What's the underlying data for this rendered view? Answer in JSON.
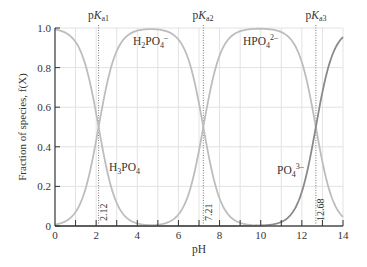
{
  "chart_data": {
    "type": "line",
    "title": "",
    "xlabel": "pH",
    "ylabel": "Fraction of species, f(X)",
    "xlim": [
      0,
      14
    ],
    "ylim": [
      0,
      1.0
    ],
    "grid": true,
    "x_ticks": [
      0,
      2,
      4,
      6,
      8,
      10,
      12,
      14
    ],
    "y_ticks": [
      0,
      0.2,
      0.4,
      0.6,
      0.8,
      1.0
    ],
    "y_tick_labels": [
      "0",
      "0.2",
      "0.4",
      "0.6",
      "0.8",
      "1.0"
    ],
    "pKa": [
      {
        "label": "pKa1",
        "value": 2.12
      },
      {
        "label": "pKa2",
        "value": 7.21
      },
      {
        "label": "pKa3",
        "value": 12.68
      }
    ],
    "series": [
      {
        "name": "H3PO4",
        "label_main": "H",
        "color": "#bdbdbd"
      },
      {
        "name": "H2PO4-",
        "color": "#bdbdbd"
      },
      {
        "name": "HPO4 2-",
        "color": "#bdbdbd"
      },
      {
        "name": "PO4 3-",
        "color": "#8a8a8a"
      }
    ],
    "sample_points": {
      "x": [
        0,
        1,
        2.12,
        3,
        4,
        5,
        6,
        7.21,
        8,
        9,
        10,
        11,
        12,
        12.68,
        14
      ],
      "H3PO4": [
        0.99,
        0.93,
        0.5,
        0.12,
        0.01,
        0.0,
        0.0,
        0.0,
        0.0,
        0.0,
        0.0,
        0.0,
        0.0,
        0.0,
        0.0
      ],
      "H2PO4-": [
        0.01,
        0.07,
        0.5,
        0.88,
        0.99,
        0.99,
        0.94,
        0.5,
        0.14,
        0.02,
        0.0,
        0.0,
        0.0,
        0.0,
        0.0
      ],
      "HPO4 2-": [
        0.0,
        0.0,
        0.0,
        0.0,
        0.0,
        0.01,
        0.06,
        0.5,
        0.86,
        0.98,
        1.0,
        0.98,
        0.83,
        0.5,
        0.05
      ],
      "PO4 3-": [
        0.0,
        0.0,
        0.0,
        0.0,
        0.0,
        0.0,
        0.0,
        0.0,
        0.0,
        0.0,
        0.0,
        0.02,
        0.17,
        0.5,
        0.95
      ]
    }
  },
  "labels": {
    "pKa1": {
      "p": "p",
      "K": "K",
      "sub": "a1"
    },
    "pKa2": {
      "p": "p",
      "K": "K",
      "sub": "a2"
    },
    "pKa3": {
      "p": "p",
      "K": "K",
      "sub": "a3"
    },
    "pKa1_value": "2.12",
    "pKa2_value": "7.21",
    "pKa3_value": "12.68",
    "H3PO4": {
      "a": "H",
      "s1": "3",
      "b": "PO",
      "s2": "4",
      "sup": ""
    },
    "H2PO4": {
      "a": "H",
      "s1": "2",
      "b": "PO",
      "s2": "4",
      "sup": "–"
    },
    "HPO4": {
      "a": "HPO",
      "s2": "4",
      "sup": "2–"
    },
    "PO4": {
      "a": "PO",
      "s2": "4",
      "sup": "3–"
    },
    "xlabel": "pH",
    "ylabel": "Fraction of species, f(X)"
  }
}
